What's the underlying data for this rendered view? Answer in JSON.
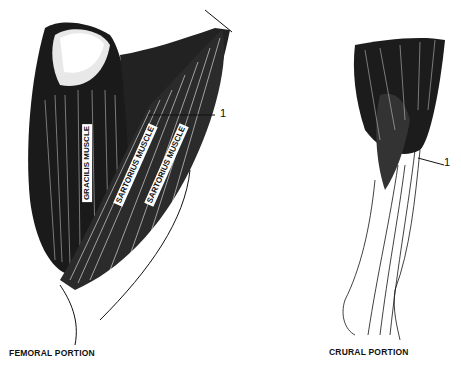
{
  "figure": {
    "panels": [
      {
        "id": "femoral",
        "caption": "FEMORAL PORTION",
        "labels": [
          "GRACILIS MUSCLE",
          "SARTORIUS MUSCLE",
          "SARTORIUS MUSCLE"
        ],
        "callout": "1"
      },
      {
        "id": "crural",
        "caption": "CRURAL PORTION",
        "callout": "1"
      }
    ],
    "colors": {
      "ink": "#111111",
      "paper": "#ffffff"
    }
  }
}
